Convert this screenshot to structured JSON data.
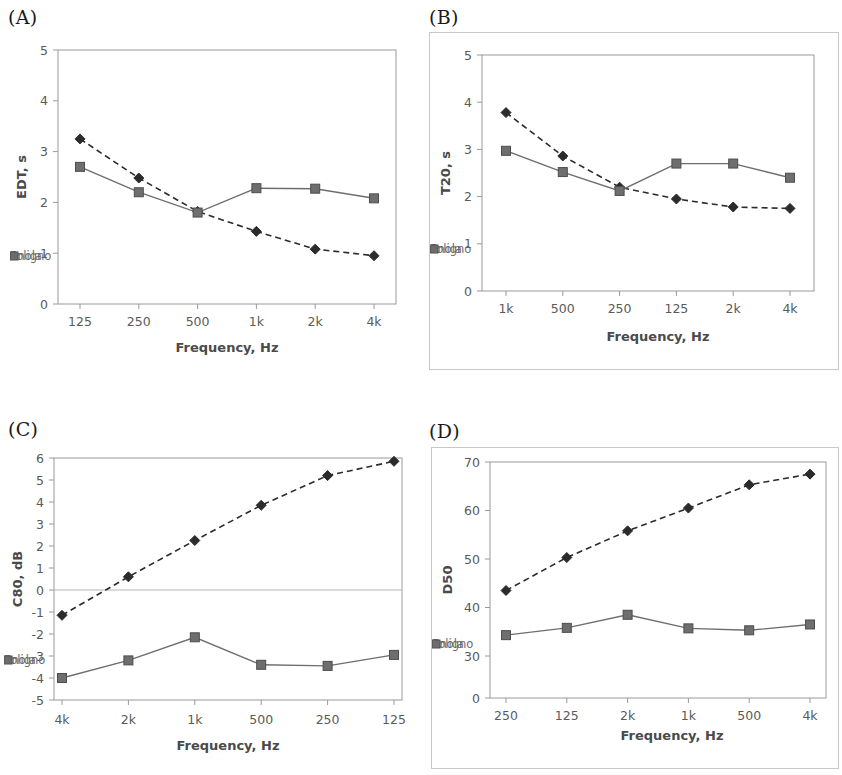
{
  "figure": {
    "background": "#ffffff",
    "series_colors": {
      "foligno": "#2b2b2b",
      "imola": "#6e6e6e"
    },
    "axis_color": "#9a9a9a",
    "text_color": "#5a5a5a"
  },
  "panels": [
    {
      "id": "A",
      "label": "(A)",
      "bordered": false,
      "chart_data": {
        "type": "line",
        "title": "",
        "xlabel": "Frequency, Hz",
        "ylabel": "EDT, s",
        "categories": [
          "125",
          "250",
          "500",
          "1k",
          "2k",
          "4k"
        ],
        "yticks": [
          0,
          1,
          2,
          3,
          4,
          5
        ],
        "ylim": [
          0,
          5
        ],
        "grid": false,
        "legend_position": "inside-bottom",
        "series": [
          {
            "name": "Foligno",
            "marker": "diamond",
            "linestyle": "dashed",
            "color": "#2b2b2b",
            "values": [
              3.25,
              2.48,
              1.82,
              1.43,
              1.08,
              0.95
            ]
          },
          {
            "name": "Imola",
            "marker": "square",
            "linestyle": "solid",
            "color": "#6e6e6e",
            "values": [
              2.7,
              2.2,
              1.8,
              2.28,
              2.27,
              2.08
            ]
          }
        ]
      }
    },
    {
      "id": "B",
      "label": "(B)",
      "bordered": true,
      "chart_data": {
        "type": "line",
        "title": "",
        "xlabel": "Frequency, Hz",
        "ylabel": "T20, s",
        "categories": [
          "1k",
          "500",
          "250",
          "125",
          "2k",
          "4k"
        ],
        "yticks": [
          0,
          1,
          2,
          3,
          4,
          5
        ],
        "ylim": [
          0,
          5
        ],
        "grid": false,
        "legend_position": "inside-bottom",
        "series": [
          {
            "name": "Foligno",
            "marker": "diamond",
            "linestyle": "dashed",
            "color": "#2b2b2b",
            "values": [
              3.78,
              2.86,
              2.2,
              1.95,
              1.78,
              1.75
            ]
          },
          {
            "name": "Imola",
            "marker": "square",
            "linestyle": "solid",
            "color": "#6e6e6e",
            "values": [
              2.97,
              2.52,
              2.12,
              2.7,
              2.7,
              2.4
            ]
          }
        ]
      }
    },
    {
      "id": "C",
      "label": "(C)",
      "bordered": false,
      "chart_data": {
        "type": "line",
        "title": "",
        "xlabel": "Frequency, Hz",
        "ylabel": "C80, dB",
        "categories": [
          "4k",
          "2k",
          "1k",
          "500",
          "250",
          "125"
        ],
        "yticks": [
          -5,
          -4,
          -3,
          -2,
          -1,
          0,
          1,
          2,
          3,
          4,
          5,
          6
        ],
        "ylim": [
          -5,
          6
        ],
        "grid": false,
        "zeroline": true,
        "legend_position": "inside-bottom",
        "series": [
          {
            "name": "Foligno",
            "marker": "diamond",
            "linestyle": "dashed",
            "color": "#2b2b2b",
            "values": [
              -1.15,
              0.6,
              2.25,
              3.85,
              5.2,
              5.85
            ]
          },
          {
            "name": "Imola",
            "marker": "square",
            "linestyle": "solid",
            "color": "#6e6e6e",
            "values": [
              -4.0,
              -3.2,
              -2.15,
              -3.4,
              -3.45,
              -2.95
            ]
          }
        ]
      }
    },
    {
      "id": "D",
      "label": "(D)",
      "bordered": true,
      "chart_data": {
        "type": "line",
        "title": "",
        "xlabel": "Frequency, Hz",
        "ylabel": "D50",
        "categories": [
          "250",
          "125",
          "2k",
          "1k",
          "500",
          "4k"
        ],
        "yticks": [
          0,
          30,
          40,
          50,
          60,
          70
        ],
        "ylim": [
          0,
          70
        ],
        "axis_break": true,
        "grid": false,
        "legend_position": "inside-bottom",
        "series": [
          {
            "name": "Foligno",
            "marker": "diamond",
            "linestyle": "dashed",
            "color": "#2b2b2b",
            "values": [
              43.5,
              50.3,
              55.8,
              60.5,
              65.3,
              67.5
            ]
          },
          {
            "name": "Imola",
            "marker": "square",
            "linestyle": "solid",
            "color": "#6e6e6e",
            "values": [
              34.3,
              35.8,
              38.5,
              35.7,
              35.3,
              36.5
            ]
          }
        ]
      }
    }
  ]
}
